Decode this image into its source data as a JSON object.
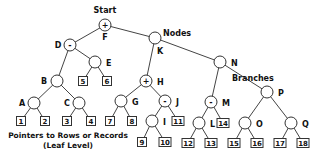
{
  "labels": {
    "start": "Start",
    "nodes": "Nodes",
    "branches": "Branches",
    "leaf_line1": "Pointers to Rows or Records",
    "leaf_line2": "(Leaf Level)"
  },
  "nodes": [
    {
      "id": "F",
      "x": 105,
      "y": 25,
      "sign": "+",
      "lx": 105,
      "ly": 40,
      "anchor": "middle"
    },
    {
      "id": "D",
      "x": 70,
      "y": 45,
      "sign": "-",
      "lx": 58,
      "ly": 48,
      "anchor": "middle"
    },
    {
      "id": "K",
      "x": 155,
      "y": 38,
      "sign": "",
      "lx": 160,
      "ly": 54,
      "anchor": "middle"
    },
    {
      "id": "E",
      "x": 95,
      "y": 62,
      "sign": "",
      "lx": 106,
      "ly": 66,
      "anchor": "start"
    },
    {
      "id": "B",
      "x": 57,
      "y": 81,
      "sign": "",
      "lx": 44,
      "ly": 84,
      "anchor": "middle"
    },
    {
      "id": "A",
      "x": 34,
      "y": 103,
      "sign": "",
      "lx": 22,
      "ly": 106,
      "anchor": "middle"
    },
    {
      "id": "C",
      "x": 79,
      "y": 103,
      "sign": "",
      "lx": 67,
      "ly": 106,
      "anchor": "middle"
    },
    {
      "id": "H",
      "x": 146,
      "y": 81,
      "sign": "+",
      "lx": 157,
      "ly": 85,
      "anchor": "start"
    },
    {
      "id": "G",
      "x": 121,
      "y": 101,
      "sign": "",
      "lx": 132,
      "ly": 105,
      "anchor": "start"
    },
    {
      "id": "J",
      "x": 165,
      "y": 101,
      "sign": "-",
      "lx": 176,
      "ly": 105,
      "anchor": "start"
    },
    {
      "id": "I",
      "x": 152,
      "y": 121,
      "sign": "",
      "lx": 163,
      "ly": 125,
      "anchor": "start"
    },
    {
      "id": "N",
      "x": 220,
      "y": 62,
      "sign": "",
      "lx": 231,
      "ly": 66,
      "anchor": "start"
    },
    {
      "id": "M",
      "x": 211,
      "y": 102,
      "sign": "-",
      "lx": 222,
      "ly": 106,
      "anchor": "start"
    },
    {
      "id": "L",
      "x": 199,
      "y": 123,
      "sign": "",
      "lx": 210,
      "ly": 127,
      "anchor": "start"
    },
    {
      "id": "P",
      "x": 267,
      "y": 92,
      "sign": "",
      "lx": 278,
      "ly": 96,
      "anchor": "start"
    },
    {
      "id": "O",
      "x": 245,
      "y": 123,
      "sign": "",
      "lx": 256,
      "ly": 127,
      "anchor": "start"
    },
    {
      "id": "Q",
      "x": 291,
      "y": 123,
      "sign": "",
      "lx": 302,
      "ly": 127,
      "anchor": "start"
    }
  ],
  "leaves": [
    {
      "n": "1",
      "x": 21,
      "y": 121
    },
    {
      "n": "2",
      "x": 45,
      "y": 121
    },
    {
      "n": "3",
      "x": 67,
      "y": 121
    },
    {
      "n": "4",
      "x": 91,
      "y": 121
    },
    {
      "n": "5",
      "x": 83,
      "y": 81
    },
    {
      "n": "6",
      "x": 107,
      "y": 81
    },
    {
      "n": "7",
      "x": 110,
      "y": 121
    },
    {
      "n": "8",
      "x": 132,
      "y": 121
    },
    {
      "n": "9",
      "x": 142,
      "y": 142
    },
    {
      "n": "10",
      "x": 165,
      "y": 142
    },
    {
      "n": "11",
      "x": 178,
      "y": 121
    },
    {
      "n": "12",
      "x": 188,
      "y": 143
    },
    {
      "n": "13",
      "x": 211,
      "y": 143
    },
    {
      "n": "14",
      "x": 223,
      "y": 123
    },
    {
      "n": "15",
      "x": 234,
      "y": 143
    },
    {
      "n": "16",
      "x": 257,
      "y": 143
    },
    {
      "n": "17",
      "x": 280,
      "y": 143
    },
    {
      "n": "18",
      "x": 303,
      "y": 143
    }
  ],
  "edges": [
    [
      "F",
      "D"
    ],
    [
      "F",
      "K"
    ],
    [
      "D",
      "B"
    ],
    [
      "D",
      "E"
    ],
    [
      "E",
      "5"
    ],
    [
      "E",
      "6"
    ],
    [
      "B",
      "A"
    ],
    [
      "B",
      "C"
    ],
    [
      "A",
      "1"
    ],
    [
      "A",
      "2"
    ],
    [
      "C",
      "3"
    ],
    [
      "C",
      "4"
    ],
    [
      "K",
      "H"
    ],
    [
      "K",
      "N"
    ],
    [
      "H",
      "G"
    ],
    [
      "H",
      "J"
    ],
    [
      "G",
      "7"
    ],
    [
      "G",
      "8"
    ],
    [
      "J",
      "I"
    ],
    [
      "J",
      "11"
    ],
    [
      "I",
      "9"
    ],
    [
      "I",
      "10"
    ],
    [
      "N",
      "M"
    ],
    [
      "N",
      "P"
    ],
    [
      "M",
      "L"
    ],
    [
      "M",
      "14"
    ],
    [
      "L",
      "12"
    ],
    [
      "L",
      "13"
    ],
    [
      "P",
      "O"
    ],
    [
      "P",
      "Q"
    ],
    [
      "O",
      "15"
    ],
    [
      "O",
      "16"
    ],
    [
      "Q",
      "17"
    ],
    [
      "Q",
      "18"
    ]
  ]
}
